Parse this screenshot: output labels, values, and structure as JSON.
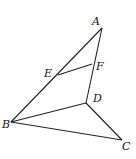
{
  "diagram": {
    "points": {
      "A": {
        "label": "A",
        "x": 102,
        "y": 28,
        "lx": 92,
        "ly": 25
      },
      "E": {
        "label": "E",
        "x": 58,
        "y": 75,
        "lx": 44,
        "ly": 77
      },
      "F": {
        "label": "F",
        "x": 92,
        "y": 64,
        "lx": 96,
        "ly": 70
      },
      "D": {
        "label": "D",
        "x": 86,
        "y": 103,
        "lx": 93,
        "ly": 102
      },
      "B": {
        "label": "B",
        "x": 11,
        "y": 122,
        "lx": 2,
        "ly": 128
      },
      "C": {
        "label": "C",
        "x": 122,
        "y": 140,
        "lx": 122,
        "ly": 150
      }
    },
    "segments": [
      [
        "A",
        "B"
      ],
      [
        "A",
        "D"
      ],
      [
        "E",
        "F"
      ],
      [
        "B",
        "D"
      ],
      [
        "B",
        "C"
      ],
      [
        "D",
        "C"
      ]
    ]
  }
}
